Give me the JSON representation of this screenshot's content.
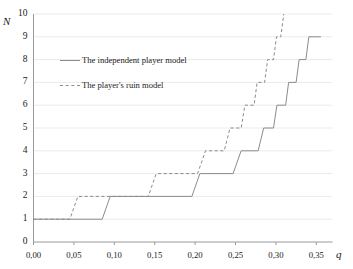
{
  "chart_data": {
    "type": "line",
    "title": "",
    "subtitle": "",
    "xlabel": "q",
    "ylabel": "N",
    "xlim": [
      0.0,
      0.37
    ],
    "ylim": [
      0,
      10
    ],
    "grid": true,
    "legend_position": "upper-left-inside",
    "step_style": "post",
    "xticks": [
      0.0,
      0.05,
      0.1,
      0.15,
      0.2,
      0.25,
      0.3,
      0.35
    ],
    "xtick_labels": [
      "0,00",
      "0,05",
      "0,10",
      "0,15",
      "0,20",
      "0,25",
      "0,30",
      "0,35"
    ],
    "yticks": [
      0,
      1,
      2,
      3,
      4,
      5,
      6,
      7,
      8,
      9,
      10
    ],
    "ytick_labels": [
      "0",
      "1",
      "2",
      "3",
      "4",
      "5",
      "6",
      "7",
      "8",
      "9",
      "10"
    ],
    "line_color": "#8c8c8c",
    "grid_color": "#ebebeb",
    "axis_color": "#9a9a9a",
    "series": [
      {
        "name": "The independent player model",
        "style": "solid",
        "color": "#8c8c8c",
        "steps": [
          {
            "q": 0.0,
            "N": 1
          },
          {
            "q": 0.085,
            "N": 2
          },
          {
            "q": 0.196,
            "N": 3
          },
          {
            "q": 0.247,
            "N": 4
          },
          {
            "q": 0.278,
            "N": 5
          },
          {
            "q": 0.297,
            "N": 6
          },
          {
            "q": 0.312,
            "N": 7
          },
          {
            "q": 0.325,
            "N": 8
          },
          {
            "q": 0.337,
            "N": 9
          },
          {
            "q": 0.352,
            "N": 9
          }
        ]
      },
      {
        "name": "The player's ruin model",
        "style": "dashed",
        "color": "#8c8c8c",
        "steps": [
          {
            "q": 0.0,
            "N": 1
          },
          {
            "q": 0.045,
            "N": 2
          },
          {
            "q": 0.142,
            "N": 3
          },
          {
            "q": 0.203,
            "N": 4
          },
          {
            "q": 0.236,
            "N": 5
          },
          {
            "q": 0.257,
            "N": 6
          },
          {
            "q": 0.273,
            "N": 7
          },
          {
            "q": 0.286,
            "N": 8
          },
          {
            "q": 0.297,
            "N": 9
          },
          {
            "q": 0.306,
            "N": 10
          }
        ]
      }
    ]
  },
  "legend": {
    "items": [
      {
        "label": "The independent player model",
        "style": "solid"
      },
      {
        "label": "The player's ruin model",
        "style": "dashed"
      }
    ]
  },
  "axes": {
    "y_label": "N",
    "x_label": "q"
  }
}
